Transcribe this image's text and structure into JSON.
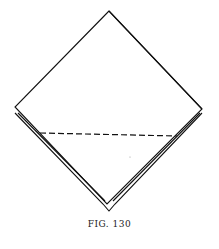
{
  "figure": {
    "caption": "FIG. 130",
    "line_color": "#111111",
    "background": "#ffffff"
  }
}
